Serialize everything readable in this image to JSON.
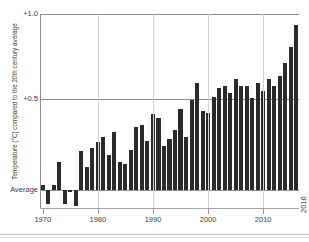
{
  "chart_data": {
    "type": "bar",
    "title": "",
    "xlabel": "",
    "ylabel": "Temperature (°C) compared to the 20th century average",
    "ylim": [
      -0.12,
      1.0
    ],
    "xlim": [
      1970,
      2016
    ],
    "grid": true,
    "legend": null,
    "y_ticks": [
      {
        "value": 1.0,
        "label": "+1.0"
      },
      {
        "value": 0.5,
        "label": "+0.5"
      },
      {
        "value": 0.0,
        "label": "Average"
      }
    ],
    "x_ticks": [
      {
        "value": 1970,
        "label": "1970"
      },
      {
        "value": 1980,
        "label": "1980"
      },
      {
        "value": 1990,
        "label": "1990"
      },
      {
        "value": 2000,
        "label": "2000"
      },
      {
        "value": 2010,
        "label": "2010"
      },
      {
        "value": 2016,
        "label": "2016"
      }
    ],
    "bar_color": "#2a2a2a",
    "categories": [
      1970,
      1971,
      1972,
      1973,
      1974,
      1975,
      1976,
      1977,
      1978,
      1979,
      1980,
      1981,
      1982,
      1983,
      1984,
      1985,
      1986,
      1987,
      1988,
      1989,
      1990,
      1991,
      1992,
      1993,
      1994,
      1995,
      1996,
      1997,
      1998,
      1999,
      2000,
      2001,
      2002,
      2003,
      2004,
      2005,
      2006,
      2007,
      2008,
      2009,
      2010,
      2011,
      2012,
      2013,
      2014,
      2015,
      2016
    ],
    "values": [
      0.03,
      -0.08,
      0.03,
      0.16,
      -0.08,
      -0.01,
      -0.09,
      0.22,
      0.13,
      0.24,
      0.27,
      0.3,
      0.2,
      0.33,
      0.16,
      0.15,
      0.23,
      0.36,
      0.37,
      0.28,
      0.43,
      0.41,
      0.25,
      0.29,
      0.34,
      0.46,
      0.3,
      0.51,
      0.61,
      0.45,
      0.44,
      0.53,
      0.58,
      0.59,
      0.55,
      0.63,
      0.59,
      0.59,
      0.52,
      0.61,
      0.56,
      0.63,
      0.59,
      0.65,
      0.72,
      0.81,
      0.94
    ]
  },
  "footer": {
    "rules": 2
  }
}
